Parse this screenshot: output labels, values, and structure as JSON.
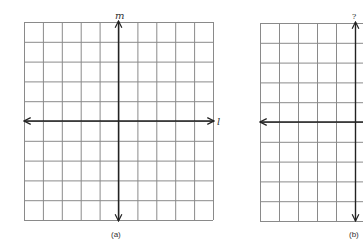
{
  "figure": {
    "panels": [
      {
        "id": "a",
        "caption": "(a)",
        "grid": {
          "columns": 10,
          "rows": 10
        },
        "vertical_axis_label": "m",
        "horizontal_axis_label": "l"
      },
      {
        "id": "b",
        "caption": "(b)",
        "grid": {
          "columns_visible": 5,
          "rows": 10
        },
        "vertical_axis_label": "?",
        "horizontal_axis_label": ""
      }
    ],
    "colors": {
      "grid": "#8a8a8a",
      "axis": "#222222",
      "text": "#333333"
    }
  }
}
